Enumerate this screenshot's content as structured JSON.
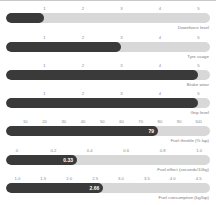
{
  "chart_data": {
    "type": "bar",
    "title": "",
    "orientation": "horizontal",
    "grid": false,
    "legend": false,
    "series": [
      {
        "name": "Downforce level",
        "caption": "Downforce level",
        "value": 1,
        "value_label": "",
        "axis_min": 0,
        "axis_max": 5.3,
        "ticks": [
          "1",
          "2",
          "3",
          "4",
          "5"
        ],
        "tick_values": [
          1,
          2,
          3,
          4,
          5
        ]
      },
      {
        "name": "Tyre usage",
        "caption": "Tyre usage",
        "value": 3,
        "value_label": "",
        "axis_min": 0,
        "axis_max": 5.3,
        "ticks": [
          "1",
          "2",
          "3",
          "4",
          "5"
        ],
        "tick_values": [
          1,
          2,
          3,
          4,
          5
        ]
      },
      {
        "name": "Brake wear",
        "caption": "Brake wear",
        "value": 5,
        "value_label": "",
        "axis_min": 0,
        "axis_max": 5.3,
        "ticks": [
          "1",
          "2",
          "3",
          "4",
          "5"
        ],
        "tick_values": [
          1,
          2,
          3,
          4,
          5
        ]
      },
      {
        "name": "Grip level",
        "caption": "Grip level",
        "value": 5,
        "value_label": "",
        "axis_min": 0,
        "axis_max": 5.3,
        "ticks": [
          "1",
          "2",
          "3",
          "4",
          "5"
        ],
        "tick_values": [
          1,
          2,
          3,
          4,
          5
        ]
      },
      {
        "name": "Fuel throttle",
        "caption": "Fuel throttle (% lap)",
        "value": 79,
        "value_label": "79",
        "axis_min": 0,
        "axis_max": 106,
        "ticks": [
          "10",
          "20",
          "30",
          "40",
          "50",
          "60",
          "70",
          "80",
          "90",
          "100"
        ],
        "tick_values": [
          10,
          20,
          30,
          40,
          50,
          60,
          70,
          80,
          90,
          100
        ]
      },
      {
        "name": "Fuel effect",
        "caption": "Fuel effect (seconds/10kg)",
        "value": 0.33,
        "value_label": "0.33",
        "axis_min": -0.06,
        "axis_max": 1.06,
        "ticks": [
          "0",
          "0.2",
          "0.4",
          "0.6",
          "0.8",
          "1.0"
        ],
        "tick_values": [
          0,
          0.2,
          0.4,
          0.6,
          0.8,
          1.0
        ]
      },
      {
        "name": "Fuel consumption",
        "caption": "Fuel consumption (kg/lap)",
        "value": 2.66,
        "value_label": "2.66",
        "axis_min": 0.78,
        "axis_max": 4.72,
        "ticks": [
          "1.0",
          "1.5",
          "2.0",
          "2.5",
          "3.0",
          "3.5",
          "4.0",
          "4.5"
        ],
        "tick_values": [
          1.0,
          1.5,
          2.0,
          2.5,
          3.0,
          3.5,
          4.0,
          4.5
        ]
      }
    ],
    "colors": {
      "fill": "#3a3a3a",
      "track": "#d8d8d8",
      "tick_text": "#8a8a8a",
      "caption_text": "#7d7d7d",
      "value_text": "#ffffff",
      "top_rule": "#c9c9c9"
    }
  }
}
